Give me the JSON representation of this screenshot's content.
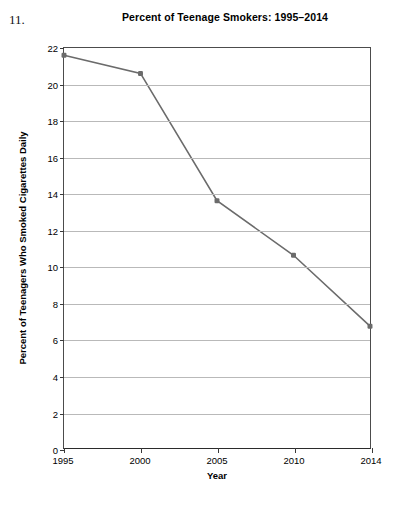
{
  "item_number": "11.",
  "axis_title_y": "Percent of Teenagers Who Smoked Cigarettes Daily",
  "axis_title_x": "Year",
  "colors": {
    "line": "#6b6b6b",
    "marker": "#6b6b6b",
    "grid": "#b9b9b9",
    "axis": "#3a3a3a",
    "background": "#ffffff",
    "text": "#000000"
  },
  "chart_data": {
    "type": "line",
    "title": "Percent of Teenage Smokers: 1995–2014",
    "xlabel": "Year",
    "ylabel": "Percent of Teenagers Who Smoked Cigarettes Daily",
    "categories": [
      "1995",
      "2000",
      "2005",
      "2010",
      "2014"
    ],
    "x": [
      1995,
      2000,
      2005,
      2010,
      2014
    ],
    "values": [
      21.6,
      20.6,
      13.6,
      10.6,
      6.7
    ],
    "series": [
      {
        "name": "Percent of teenagers who smoked cigarettes daily",
        "values": [
          21.6,
          20.6,
          13.6,
          10.6,
          6.7
        ]
      }
    ],
    "ylim": [
      0,
      22
    ],
    "xtick_labels": [
      "1995",
      "2000",
      "2005",
      "2010",
      "2014"
    ],
    "ytick_labels": [
      "0",
      "2",
      "4",
      "6",
      "8",
      "10",
      "12",
      "14",
      "16",
      "18",
      "20",
      "22"
    ],
    "ytick_values": [
      0,
      2,
      4,
      6,
      8,
      10,
      12,
      14,
      16,
      18,
      20,
      22
    ],
    "grid": "horizontal",
    "legend": "none",
    "marker": "filled-square",
    "spacing": "categorical-even"
  }
}
